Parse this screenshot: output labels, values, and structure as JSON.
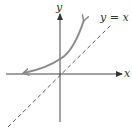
{
  "diagram": {
    "type": "function-graph",
    "axes": {
      "x_label": "x",
      "y_label": "y"
    },
    "curves": [
      {
        "name": "exponential-curve",
        "description": "increasing curve with horizontal asymptote on left, arrows on both ends",
        "color": "#8a8a8a"
      },
      {
        "name": "identity-line",
        "label": "y = x",
        "style": "dashed",
        "color": "#444444"
      }
    ]
  }
}
